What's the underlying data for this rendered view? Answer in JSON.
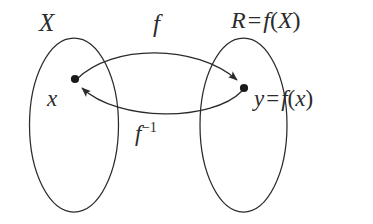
{
  "figure": {
    "kind": "set-mapping-diagram",
    "background_color": "#ffffff",
    "stroke_color": "#2b2b2b",
    "caption_text": "Diagram of a function f from set X onto its range R = f(X), with the inverse map f inverse returning y to x."
  },
  "sets": {
    "domain": {
      "label": "X",
      "name": "domain-set"
    },
    "range": {
      "label_full": "R = f(X)",
      "label_symbol": "R",
      "label_equals": "=",
      "label_expression_fn": "f",
      "label_expression_open": "(",
      "label_expression_arg": "X",
      "label_expression_close": ")",
      "name": "range-set"
    }
  },
  "elements": {
    "source_point": {
      "label": "x",
      "dot_label": "x-dot"
    },
    "target_point": {
      "label_full": "y = f(x)",
      "label_symbol": "y",
      "label_equals": "=",
      "label_expression_fn": "f",
      "label_expression_open": "(",
      "label_expression_arg": "x",
      "label_expression_close": ")",
      "dot_label": "y-dot"
    }
  },
  "maps": {
    "forward": {
      "label": "f",
      "direction": "domain-to-range"
    },
    "inverse": {
      "label_base": "f",
      "label_exponent": "−1",
      "direction": "range-to-domain"
    }
  }
}
